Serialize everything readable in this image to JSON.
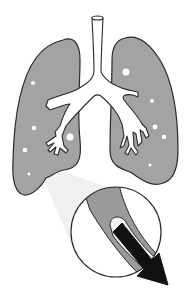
{
  "diagram": {
    "colors": {
      "background": "#ffffff",
      "lung_fill": "#a3a3a3",
      "outline": "#2a2a2a",
      "airway_fill": "#ffffff",
      "alveoli_dots": "#ffffff",
      "zoom_cone": "#f0f0f0",
      "airway_wall": "#9a9a9a",
      "airway_lumen": "#f2f2f2",
      "arrow": "#111111"
    },
    "elements": {
      "trachea": "trachea",
      "left_lung": "left-lung",
      "right_lung": "right-lung",
      "magnifier": "magnified-airway-circle",
      "arrow": "airflow-arrow"
    }
  }
}
